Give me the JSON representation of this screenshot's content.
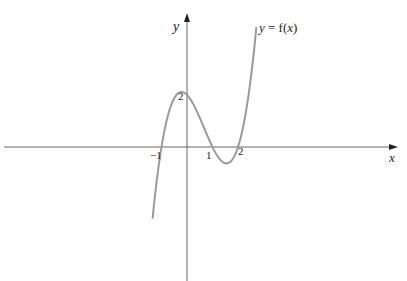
{
  "figure": {
    "curve_label_prefix": "y",
    "curve_label_eq": " = f(",
    "curve_label_var": "x",
    "curve_label_close": ")",
    "x_axis_label": "x",
    "y_axis_label": "y",
    "tick_labels": {
      "x_neg1": "−1",
      "x_1": "1",
      "x_2": "2",
      "y_2": "2"
    },
    "colors": {
      "axis": "#555555",
      "curve": "#999999",
      "text": "#222222"
    }
  },
  "chart_data": {
    "type": "line",
    "title": "",
    "xlabel": "x",
    "ylabel": "y",
    "series": [
      {
        "name": "y = f(x)",
        "expression": "(x+1)(x-1)(x-2)",
        "x": [
          -1.3,
          -1.0,
          -0.5,
          -0.2,
          0,
          0.5,
          1.0,
          1.5,
          1.55,
          2.0,
          2.5,
          2.9
        ],
        "values": [
          -3.1,
          0,
          1.9,
          2.2,
          2,
          1.1,
          0,
          -0.6,
          -0.6,
          0,
          2.6,
          6.7
        ]
      }
    ],
    "roots": [
      -1,
      1,
      2
    ],
    "y_intercept": 2,
    "annotations": [
      "-1",
      "1",
      "2",
      "2"
    ],
    "grid": false
  }
}
